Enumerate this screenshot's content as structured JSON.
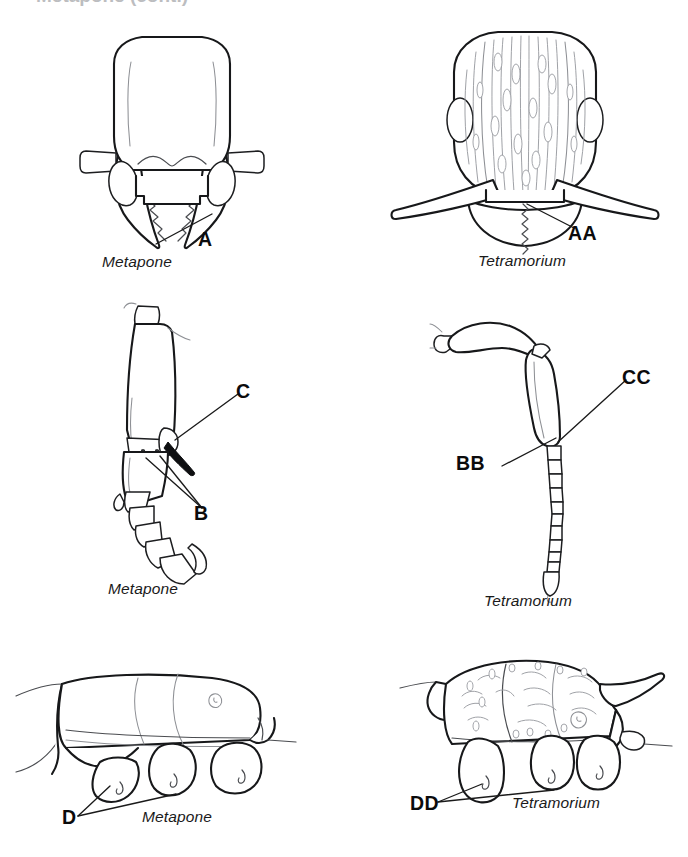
{
  "plate": {
    "background_color": "#ffffff",
    "ink_color": "#17181a",
    "sculpture_color": "#9a9ca1",
    "header_remnant": "Metapone (cont.)"
  },
  "panels": [
    {
      "id": "metapone-head",
      "position": "top-left",
      "subject": "Metapone",
      "view": "full-face head with mandibles",
      "caption": "Metapone",
      "callouts": [
        {
          "label": "A",
          "points_to": "mandible masticatory margin with serrate teeth",
          "leader_count": 1
        }
      ],
      "features": [
        "head rectangular, smooth and unsculptured",
        "antennal scrobes / scapes short and club-like laterally",
        "clypeus with shallow median concavity",
        "mandibles elongate, falcate, with serrate inner margin"
      ]
    },
    {
      "id": "tetramorium-head",
      "position": "top-right",
      "subject": "Tetramorium",
      "view": "full-face head with mandibles",
      "caption": "Tetramorium",
      "callouts": [
        {
          "label": "AA",
          "points_to": "mandible masticatory margin with teeth",
          "leader_count": 1
        }
      ],
      "features": [
        "head densely longitudinally rugose",
        "oval compound eyes placed laterally",
        "long antennal scapes extending beyond head sides",
        "mandibles triangular, broad"
      ]
    },
    {
      "id": "metapone-leg",
      "position": "middle-left",
      "subject": "Metapone",
      "view": "leg, tibia and tarsus",
      "caption": "Metapone",
      "callouts": [
        {
          "label": "B",
          "points_to": "paired tibial spurs",
          "leader_count": 2
        },
        {
          "label": "C",
          "points_to": "large pectinate tibial spur",
          "leader_count": 1
        }
      ],
      "features": [
        "tibia stout and broadened",
        "two spurs present at tibial apex",
        "tarsus short with clawed pretarsus"
      ]
    },
    {
      "id": "tetramorium-antenna",
      "position": "middle-right",
      "subject": "Tetramorium",
      "view": "antenna, scape and funiculus",
      "caption": "Tetramorium",
      "callouts": [
        {
          "label": "BB",
          "points_to": "scape apex at funicular joint",
          "leader_count": 1
        },
        {
          "label": "CC",
          "points_to": "base of funiculus",
          "leader_count": 1
        }
      ],
      "features": [
        "scape long and gently curved",
        "funiculus of many short segments",
        "apical club weakly differentiated"
      ]
    },
    {
      "id": "metapone-mesosoma",
      "position": "bottom-left",
      "subject": "Metapone",
      "view": "mesosoma in lateral profile",
      "caption": "Metapone",
      "callouts": [
        {
          "label": "D",
          "points_to": "enlarged coxae",
          "leader_count": 2
        }
      ],
      "features": [
        "mesosomal dorsum smooth and evenly convex",
        "propodeum unarmed, lacking spines",
        "coxae large and rounded"
      ]
    },
    {
      "id": "tetramorium-mesosoma",
      "position": "bottom-right",
      "subject": "Tetramorium",
      "view": "mesosoma in lateral profile",
      "caption": "Tetramorium",
      "callouts": [
        {
          "label": "DD",
          "points_to": "coxae",
          "leader_count": 2
        }
      ],
      "features": [
        "mesosoma rugose and punctate",
        "propodeum with a pair of long spines",
        "pronotal angle produced anteriorly",
        "coxae smaller than in Metapone"
      ]
    }
  ]
}
